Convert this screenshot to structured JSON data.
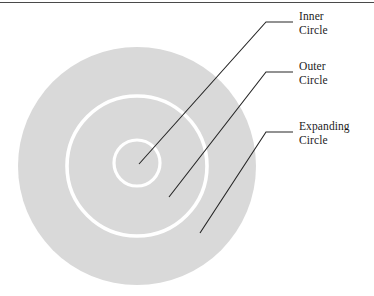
{
  "figure": {
    "border_rule_color": "#4a4a4a",
    "background_color": "#ffffff",
    "disc_fill_color": "#d9d9d9",
    "ring_stroke_color": "#ffffff",
    "leader_line_color": "#262626",
    "expanding_circle": {
      "cx": 137,
      "cy": 166,
      "r": 119
    },
    "outer_circle": {
      "cx": 137,
      "cy": 166,
      "r": 70
    },
    "inner_circle": {
      "cx": 137,
      "cy": 163,
      "r": 23
    }
  },
  "labels": [
    {
      "id": "inner",
      "line1": "Inner",
      "line2": "Circle",
      "leader": {
        "elbow_x": 293,
        "elbow_y": 22,
        "bend_x": 266,
        "bend_y": 22,
        "tip_x": 139,
        "tip_y": 164
      }
    },
    {
      "id": "outer",
      "line1": "Outer",
      "line2": "Circle",
      "leader": {
        "elbow_x": 293,
        "elbow_y": 72,
        "bend_x": 266,
        "bend_y": 72,
        "tip_x": 169,
        "tip_y": 197
      }
    },
    {
      "id": "expanding",
      "line1": "Expanding",
      "line2": "Circle",
      "leader": {
        "elbow_x": 293,
        "elbow_y": 132,
        "bend_x": 266,
        "bend_y": 132,
        "tip_x": 200,
        "tip_y": 233
      }
    }
  ]
}
